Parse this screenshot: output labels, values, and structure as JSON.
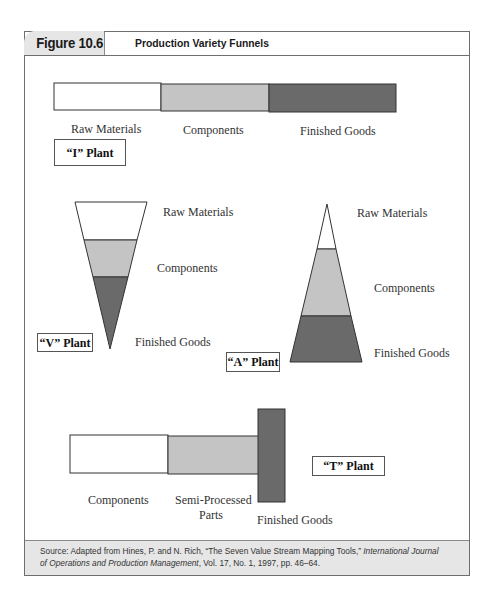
{
  "figure": {
    "number": "Figure 10.6",
    "title": "Production Variety Funnels"
  },
  "colors": {
    "raw": "#ffffff",
    "components": "#c4c4c4",
    "finished": "#6a6a6a",
    "stroke": "#333333",
    "header_tab_bg": "#e6e6e6",
    "footer_bg": "#e6e6e6"
  },
  "i_plant": {
    "label": "“I” Plant",
    "stages": [
      "Raw Materials",
      "Components",
      "Finished Goods"
    ]
  },
  "v_plant": {
    "label": "“V” Plant",
    "stages": [
      "Raw Materials",
      "Components",
      "Finished Goods"
    ]
  },
  "a_plant": {
    "label": "“A” Plant",
    "stages": [
      "Raw Materials",
      "Components",
      "Finished Goods"
    ]
  },
  "t_plant": {
    "label": "“T” Plant",
    "stages": [
      "Components",
      "Semi-Processed",
      "Parts",
      "Finished Goods"
    ]
  },
  "source": {
    "prefix": "Source: Adapted from Hines, P. and N. Rich, “The Seven Value Stream Mapping Tools,” ",
    "journal_line1": "International Journal",
    "journal_line2": "of Operations and Production Management",
    "suffix": ", Vol. 17, No. 1, 1997, pp. 46–64."
  }
}
